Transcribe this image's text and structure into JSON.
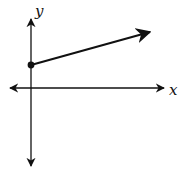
{
  "diagram": {
    "type": "coordinate-plane-ray",
    "axes": {
      "x_label": "x",
      "y_label": "y"
    },
    "ray": {
      "start_point": "closed circle on y-axis above origin",
      "direction": "up and to the right, positive slope"
    },
    "colors": {
      "stroke": "#111111",
      "background": "#ffffff"
    }
  }
}
